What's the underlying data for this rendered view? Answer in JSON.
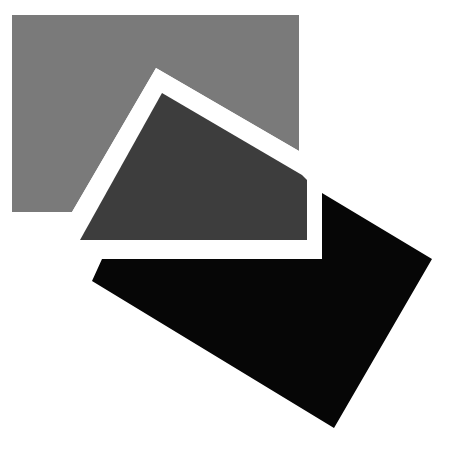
{
  "artwork": {
    "background_color": "#ffffff",
    "width": 461,
    "height": 462,
    "shapes": {
      "light_gray_panel": {
        "color": "#7a7a7a",
        "points": "12,15 299,15 299,151 156,68 72,212 12,212"
      },
      "white_frame": {
        "color": "#ffffff",
        "points": "156,68 299,151 322,164 322,259 72,259 80,240 72,212"
      },
      "dark_gray_panel": {
        "color": "#3d3d3d",
        "points": "162,93 302,175 307,180 307,240 80,240"
      },
      "black_panel": {
        "color": "#060606",
        "points": "322,193 432,259 334,428 92,281 102,259 322,259"
      }
    }
  }
}
